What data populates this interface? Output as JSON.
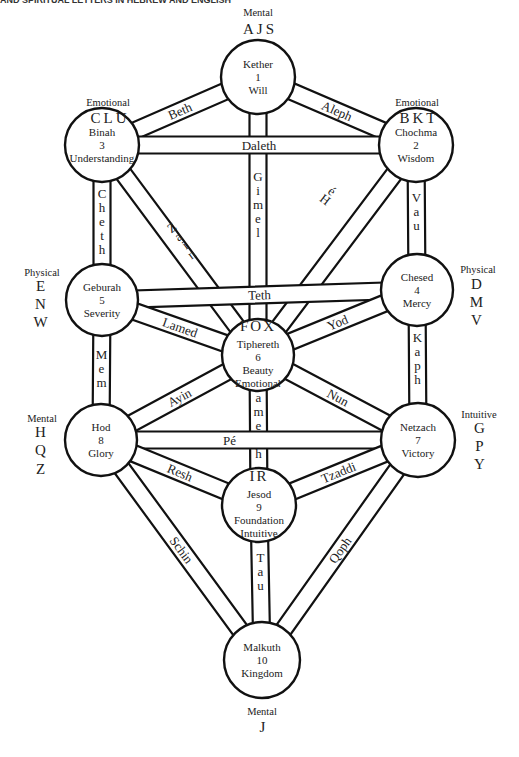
{
  "header_fragment": "AND SPIRITUAL LETTERS IN HEBREW AND ENGLISH",
  "nodes": [
    {
      "id": "kether",
      "name": "Kether",
      "number": "1",
      "meaning": "Will",
      "cx": 258,
      "cy": 77,
      "r": 37
    },
    {
      "id": "chochma",
      "name": "Chochma",
      "number": "2",
      "meaning": "Wisdom",
      "cx": 416,
      "cy": 145,
      "r": 37
    },
    {
      "id": "binah",
      "name": "Binah",
      "number": "3",
      "meaning": "Understanding",
      "cx": 102,
      "cy": 145,
      "r": 37
    },
    {
      "id": "chesed",
      "name": "Chesed",
      "number": "4",
      "meaning": "Mercy",
      "cx": 417,
      "cy": 290,
      "r": 36
    },
    {
      "id": "geburah",
      "name": "Geburah",
      "number": "5",
      "meaning": "Severity",
      "cx": 102,
      "cy": 300,
      "r": 36
    },
    {
      "id": "tiphereth",
      "name": "Tiphereth",
      "number": "6",
      "meaning": "Beauty",
      "extra": "Emotional",
      "letters": "FOX",
      "cx": 258,
      "cy": 355,
      "r": 36
    },
    {
      "id": "netzach",
      "name": "Netzach",
      "number": "7",
      "meaning": "Victory",
      "cx": 418,
      "cy": 440,
      "r": 37
    },
    {
      "id": "hod",
      "name": "Hod",
      "number": "8",
      "meaning": "Glory",
      "cx": 101,
      "cy": 440,
      "r": 36
    },
    {
      "id": "jesod",
      "name": "Jesod",
      "number": "9",
      "meaning": "Foundation",
      "extra": "Intuitive",
      "letters": "IR",
      "cx": 259,
      "cy": 505,
      "r": 37
    },
    {
      "id": "malkuth",
      "name": "Malkuth",
      "number": "10",
      "meaning": "Kingdom",
      "cx": 262,
      "cy": 660,
      "r": 38
    }
  ],
  "paths": [
    {
      "name": "Aleph",
      "from": "kether",
      "to": "chochma"
    },
    {
      "name": "Beth",
      "from": "kether",
      "to": "binah"
    },
    {
      "name": "Gimel",
      "from": "kether",
      "to": "tiphereth"
    },
    {
      "name": "Daleth",
      "from": "chochma",
      "to": "binah"
    },
    {
      "name": "Hé",
      "from": "chochma",
      "to": "tiphereth"
    },
    {
      "name": "Vau",
      "from": "chochma",
      "to": "chesed"
    },
    {
      "name": "Zain",
      "from": "binah",
      "to": "tiphereth"
    },
    {
      "name": "Cheth",
      "from": "binah",
      "to": "geburah"
    },
    {
      "name": "Teth",
      "from": "chesed",
      "to": "geburah"
    },
    {
      "name": "Yod",
      "from": "chesed",
      "to": "tiphereth"
    },
    {
      "name": "Kaph",
      "from": "chesed",
      "to": "netzach"
    },
    {
      "name": "Lamed",
      "from": "geburah",
      "to": "tiphereth"
    },
    {
      "name": "Mem",
      "from": "geburah",
      "to": "hod"
    },
    {
      "name": "Nun",
      "from": "tiphereth",
      "to": "netzach"
    },
    {
      "name": "Samekh",
      "from": "tiphereth",
      "to": "jesod"
    },
    {
      "name": "Ayin",
      "from": "tiphereth",
      "to": "hod"
    },
    {
      "name": "Pé",
      "from": "netzach",
      "to": "hod"
    },
    {
      "name": "Tzaddi",
      "from": "netzach",
      "to": "jesod"
    },
    {
      "name": "Qoph",
      "from": "netzach",
      "to": "malkuth"
    },
    {
      "name": "Resh",
      "from": "hod",
      "to": "jesod"
    },
    {
      "name": "Schin",
      "from": "hod",
      "to": "malkuth"
    },
    {
      "name": "Tau",
      "from": "jesod",
      "to": "malkuth"
    }
  ],
  "annotations": {
    "kether": {
      "category": "Mental",
      "letters": "AJS"
    },
    "binah": {
      "category": "Emotional",
      "letters": "CLU"
    },
    "chochma": {
      "category": "Emotional",
      "letters": "BKT"
    },
    "geburah": {
      "category": "Physical",
      "letters": [
        "E",
        "N",
        "W"
      ]
    },
    "chesed": {
      "category": "Physical",
      "letters": [
        "D",
        "M",
        "V"
      ]
    },
    "hod": {
      "category": "Mental",
      "letters": [
        "H",
        "Q",
        "Z"
      ]
    },
    "netzach": {
      "category": "Intuitive",
      "letters": [
        "G",
        "P",
        "Y"
      ]
    },
    "malkuth": {
      "category": "Mental",
      "letters": "J"
    }
  }
}
